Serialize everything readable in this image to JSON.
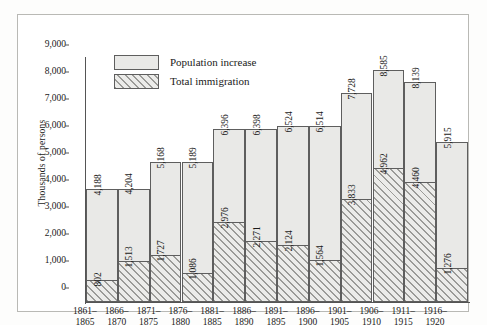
{
  "chart_data": {
    "type": "bar",
    "title": "",
    "subtitle": "",
    "xlabel": "",
    "ylabel": "Thousands of persons",
    "ylim": [
      0,
      9000
    ],
    "yticks": [
      "0",
      "1,000",
      "2,000",
      "3,000",
      "4,000",
      "5,000",
      "6,000",
      "7,000",
      "8,000",
      "9,000"
    ],
    "ytick_values": [
      0,
      1000,
      2000,
      3000,
      4000,
      5000,
      6000,
      7000,
      8000,
      9000
    ],
    "grid": false,
    "legend_position": "top-left",
    "categories": [
      "1861–1865",
      "1866–1870",
      "1871–1875",
      "1876–1880",
      "1881–1885",
      "1886–1890",
      "1891–1895",
      "1896–1900",
      "1901–1905",
      "1906–1910",
      "1911–1915",
      "1916–1920"
    ],
    "category_lines": [
      [
        "1861–",
        "1865"
      ],
      [
        "1866–",
        "1870"
      ],
      [
        "1871–",
        "1875"
      ],
      [
        "1876–",
        "1880"
      ],
      [
        "1881–",
        "1885"
      ],
      [
        "1886–",
        "1890"
      ],
      [
        "1891–",
        "1895"
      ],
      [
        "1896–",
        "1900"
      ],
      [
        "1901–",
        "1905"
      ],
      [
        "1906–",
        "1910"
      ],
      [
        "1911–",
        "1915"
      ],
      [
        "1916–",
        "1920"
      ]
    ],
    "series": [
      {
        "name": "Population increase",
        "style": "solid-fill",
        "color": "#e9e9e7",
        "values": [
          4188,
          4204,
          5168,
          5189,
          6396,
          6398,
          6524,
          6514,
          7728,
          8585,
          8139,
          5915
        ],
        "labels": [
          "4,188",
          "4,204",
          "5,168",
          "5,189",
          "6,396",
          "6,398",
          "6,524",
          "6,514",
          "7,728",
          "8,585",
          "8,139",
          "5,915"
        ]
      },
      {
        "name": "Total immigration",
        "style": "diagonal-hatch",
        "color": "#9b9b98",
        "values": [
          802,
          1513,
          1727,
          1086,
          2976,
          2271,
          2124,
          1564,
          3833,
          4962,
          4460,
          1276
        ],
        "labels": [
          "802",
          "1,513",
          "1,727",
          "1,086",
          "2,976",
          "2,271",
          "2,124",
          "1,564",
          "3,833",
          "4,962",
          "4,460",
          "1,276"
        ]
      }
    ]
  },
  "legend": {
    "items": [
      {
        "label": "Population increase"
      },
      {
        "label": "Total immigration"
      }
    ]
  }
}
